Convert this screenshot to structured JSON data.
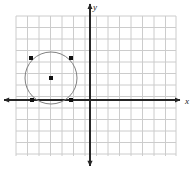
{
  "figure": {
    "width": 196,
    "height": 170,
    "background_color": "#ffffff"
  },
  "axes": {
    "x_axis": {
      "label": "x",
      "label_x": 187,
      "label_y": 102,
      "color": "#262626",
      "y_pixel": 100,
      "start_x": 4,
      "end_x": 180,
      "stroke_width": 2,
      "arrow_start": true,
      "arrow_end": true
    },
    "y_axis": {
      "label": "y",
      "label_x": 95,
      "label_y": 8,
      "color": "#262626",
      "x_pixel": 90,
      "start_y": 4,
      "end_y": 166,
      "stroke_width": 2,
      "arrow_start": true,
      "arrow_end": true
    }
  },
  "grid": {
    "color": "#cccccc",
    "stroke_width": 1,
    "spacing": 11.5,
    "left": 16,
    "right": 176,
    "top": 16,
    "bottom": 156,
    "vertical_lines": [
      16,
      27.5,
      39,
      50.5,
      62,
      73.5,
      85,
      96.5,
      108,
      119.5,
      131,
      142.5,
      154,
      165.5,
      176
    ],
    "horizontal_lines": [
      16,
      27.5,
      39,
      50.5,
      62,
      73.5,
      85,
      96.5,
      108,
      119.5,
      131,
      142.5,
      154
    ],
    "visible": true
  },
  "chart_data": {
    "type": "scatter",
    "title": "",
    "xlabel": "x",
    "ylabel": "y",
    "grid": true,
    "legend": "none",
    "units_per_cell": 1,
    "origin_pixel": [
      90,
      100
    ],
    "xlim": [
      -6.4,
      7.5
    ],
    "ylim": [
      -4.9,
      7.3
    ],
    "circle": {
      "center_units": [
        -3.4,
        1.9
      ],
      "radius_units": 2.25,
      "center_pixel": [
        51,
        78
      ],
      "radius_pixel": 26,
      "stroke_color": "#808080",
      "stroke_width": 1,
      "fill": "none"
    },
    "points": [
      {
        "name": "center",
        "x_units": -3.4,
        "y_units": 1.9,
        "x_pixel": 51,
        "y_pixel": 78
      },
      {
        "name": "upper-left",
        "x_units": -5.1,
        "y_units": 3.6,
        "x_pixel": 31,
        "y_pixel": 58
      },
      {
        "name": "upper-right",
        "x_units": -1.7,
        "y_units": 3.6,
        "x_pixel": 71,
        "y_pixel": 58
      },
      {
        "name": "lower-left",
        "x_units": -5.0,
        "y_units": 0.0,
        "x_pixel": 32,
        "y_pixel": 100
      },
      {
        "name": "lower-right",
        "x_units": -1.7,
        "y_units": 0.0,
        "x_pixel": 71,
        "y_pixel": 100
      }
    ],
    "point_style": {
      "color": "#111111",
      "size": 4,
      "shape": "square"
    }
  }
}
